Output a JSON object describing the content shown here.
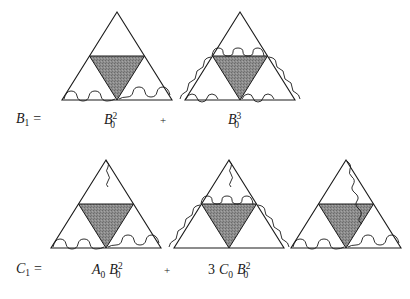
{
  "figure": {
    "type": "feynman-like recursion diagram",
    "background_color": "#ffffff",
    "line_color": "#1a1a1a",
    "shade_color": "#808080",
    "rows": [
      {
        "id": "row-B1",
        "lhs": {
          "base": "B",
          "sub": "1",
          "sup": "",
          "equals": "="
        },
        "terms": [
          {
            "id": "term-B0-squared",
            "label": {
              "coefficient": "",
              "base": "B",
              "sub": "0",
              "sup": "2"
            },
            "diagram": {
              "outer_triangle": true,
              "inner_inverted_triangle_shaded": true,
              "wavy_edges": [
                "bottom-left",
                "bottom-right"
              ],
              "apex_squiggle": false
            }
          },
          {
            "id": "term-B0-cubed",
            "operator": "+",
            "label": {
              "coefficient": "",
              "base": "B",
              "sub": "0",
              "sup": "3"
            },
            "diagram": {
              "outer_triangle": true,
              "inner_inverted_triangle_shaded": true,
              "wavy_edges": [
                "top",
                "left",
                "right",
                "bottom-left",
                "bottom-right"
              ],
              "apex_squiggle": false
            }
          }
        ]
      },
      {
        "id": "row-C1",
        "lhs": {
          "base": "C",
          "sub": "1",
          "sup": "",
          "equals": "="
        },
        "terms": [
          {
            "id": "term-A0-B0-squared",
            "label": {
              "coefficient": "",
              "base": "A",
              "sub": "0",
              "sup": "",
              "base2": "B",
              "sub2": "0",
              "sup2": "2"
            },
            "diagram": {
              "outer_triangle": true,
              "inner_inverted_triangle_shaded": true,
              "wavy_edges": [
                "bottom-left",
                "bottom-right"
              ],
              "apex_squiggle": true
            }
          },
          {
            "id": "term-3-C0-B0-squared",
            "operator": "+",
            "label": {
              "coefficient": "3",
              "base": "C",
              "sub": "0",
              "sup": "",
              "base2": "B",
              "sub2": "0",
              "sup2": "2"
            },
            "diagram": {
              "outer_triangle": true,
              "inner_inverted_triangle_shaded": true,
              "wavy_edges": [
                "top",
                "left",
                "right"
              ],
              "apex_squiggle": true
            }
          },
          {
            "id": "term-third-unlabeled",
            "label": null,
            "diagram": {
              "outer_triangle": true,
              "inner_inverted_triangle_shaded": true,
              "wavy_edges": [
                "bottom-left",
                "bottom-right"
              ],
              "apex_to_right_vertex_squiggle": true
            }
          }
        ]
      }
    ],
    "labels": {
      "B1_base": "B",
      "B1_sub": "1",
      "equals": "=",
      "plus": "+",
      "B0_sq_base": "B",
      "B0_sq_sub": "0",
      "B0_sq_sup": "2",
      "B0_cu_base": "B",
      "B0_cu_sub": "0",
      "B0_cu_sup": "3",
      "C1_base": "C",
      "C1_sub": "1",
      "A0_base": "A",
      "A0_sub": "0",
      "A0B0_base": "B",
      "A0B0_sub": "0",
      "A0B0_sup": "2",
      "coef3": "3",
      "C0_base": "C",
      "C0_sub": "0",
      "C0B0_base": "B",
      "C0B0_sub": "0",
      "C0B0_sup": "2"
    }
  }
}
